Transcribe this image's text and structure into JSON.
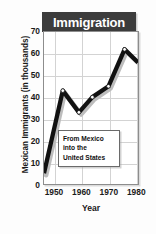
{
  "chart_data": {
    "type": "line",
    "title": "Immigration",
    "xlabel": "Year",
    "ylabel": "Mexican Immigrants (in thousands)",
    "xlim": [
      1946,
      1981
    ],
    "ylim": [
      0,
      70
    ],
    "xticks": [
      1950,
      1960,
      1970,
      1980
    ],
    "xtick_labels": [
      "1950",
      "1960",
      "1970",
      "1980"
    ],
    "yticks": [
      0,
      10,
      20,
      30,
      40,
      50,
      60,
      70
    ],
    "ytick_labels": [
      "0",
      "10",
      "20",
      "30",
      "40",
      "50",
      "60",
      "70"
    ],
    "grid": true,
    "legend": "none",
    "annotations": [
      {
        "lines": [
          "From Mexico",
          "into the",
          "United States"
        ]
      }
    ],
    "series": [
      {
        "name": "Mexican Immigrants",
        "x": [
          1946,
          1953,
          1959,
          1964,
          1970,
          1976,
          1981
        ],
        "values": [
          5,
          43,
          33,
          40,
          45,
          62,
          56
        ],
        "marker": "circle",
        "markers_visible": [
          false,
          true,
          true,
          true,
          true,
          true,
          false
        ]
      }
    ],
    "colors": {
      "line": "#111111",
      "marker_fill": "#ffffff",
      "marker_edge": "#111111",
      "grid": "#d3d3d3",
      "plot_border": "#8d8d8d",
      "title_box": "#3c3c3c",
      "title_text": "#ffffff",
      "shadow": "#bdbdbd",
      "background": "#fdfdfd"
    }
  }
}
